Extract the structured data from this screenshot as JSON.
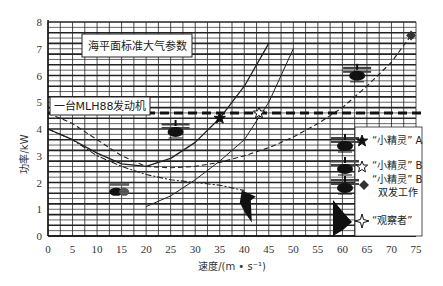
{
  "chart_data": {
    "type": "line",
    "title": "",
    "xlabel": "速度/(m • s⁻¹)",
    "ylabel": "功率/kW",
    "xlim": [
      0,
      75
    ],
    "ylim": [
      0,
      8
    ],
    "x_ticks": [
      "0",
      "5",
      "10",
      "15",
      "20",
      "25",
      "30",
      "35",
      "40",
      "45",
      "50",
      "55",
      "60",
      "65",
      "70",
      "75"
    ],
    "y_ticks": [
      "0",
      "1",
      "2",
      "3",
      "4",
      "5",
      "6",
      "7",
      "8"
    ],
    "grid": true,
    "annotations": [
      {
        "text": "海平面标准大气参数",
        "x": 12.5,
        "y": 7.45
      },
      {
        "text": "一台MLH88发动机",
        "x": 0.5,
        "y": 4.85
      }
    ],
    "reference_line": {
      "name": "一台MLH88发动机",
      "y": 4.6,
      "style": "thick-dashed"
    },
    "series": [
      {
        "name": "“小精灵”A",
        "style": "solid",
        "marker": "filled-star",
        "x": [
          0,
          5,
          10,
          15,
          20,
          25,
          30,
          35,
          40,
          45
        ],
        "y": [
          4.0,
          3.6,
          3.1,
          2.7,
          2.6,
          2.9,
          3.5,
          4.4,
          5.6,
          7.2
        ]
      },
      {
        "name": "“小精灵”B",
        "style": "solid-thin",
        "marker": "open-star",
        "x": [
          20,
          25,
          30,
          35,
          40,
          45,
          50
        ],
        "y": [
          1.1,
          1.5,
          2.1,
          2.8,
          3.6,
          5.0,
          7.0
        ]
      },
      {
        "name": "“小精灵”B 双发工作",
        "style": "dashed",
        "marker": "diamond",
        "x": [
          0,
          5,
          10,
          15,
          20,
          25,
          30,
          35,
          40,
          45,
          50,
          55,
          60,
          65,
          70,
          74
        ],
        "y": [
          4.6,
          4.2,
          3.6,
          3.0,
          2.6,
          2.55,
          2.6,
          2.75,
          3.0,
          3.3,
          3.7,
          4.2,
          4.8,
          5.6,
          6.5,
          7.5
        ]
      },
      {
        "name": "“观察者”",
        "style": "dash-dot",
        "marker": "four-point-star",
        "x": [
          0,
          5,
          10,
          15,
          20,
          25,
          30,
          35,
          40
        ],
        "y": [
          4.0,
          3.6,
          3.0,
          2.6,
          2.3,
          2.1,
          2.0,
          1.9,
          1.7
        ]
      }
    ],
    "points": [
      {
        "name": "“小精灵”A",
        "x": 35,
        "y": 4.4,
        "marker": "filled-star"
      },
      {
        "name": "“小精灵”B",
        "x": 43,
        "y": 4.6,
        "marker": "open-star"
      },
      {
        "name": "“小精灵”B 双发工作",
        "x": 74,
        "y": 7.5,
        "marker": "diamond"
      }
    ],
    "legend": {
      "position": "lower-right",
      "entries": [
        {
          "label": "“小精灵” A",
          "marker": "filled-star"
        },
        {
          "label": "“小精灵” B",
          "marker": "open-star"
        },
        {
          "label_line1": "“小精灵” B",
          "label_line2": "双发工作",
          "marker": "diamond"
        },
        {
          "label": "“观察者”",
          "marker": "four-point-star"
        }
      ]
    }
  }
}
